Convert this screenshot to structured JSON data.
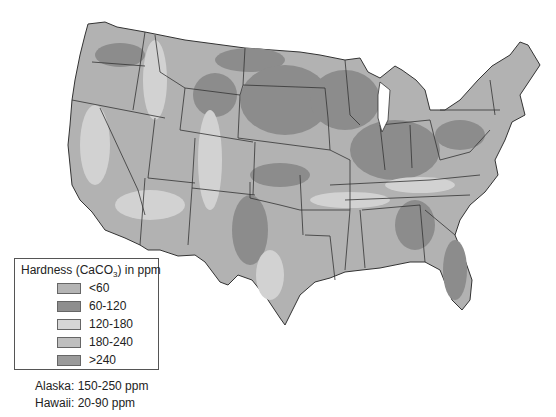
{
  "map": {
    "subject": "Water hardness across the contiguous United States",
    "region": "Contiguous United States"
  },
  "legend": {
    "title_prefix": "Hardness (CaCO",
    "title_sub": "3",
    "title_suffix": ") in ppm",
    "items": [
      {
        "label": "<60",
        "color": "#b4b4b4"
      },
      {
        "label": "60-120",
        "color": "#8e8e8e"
      },
      {
        "label": "120-180",
        "color": "#d6d6d6"
      },
      {
        "label": "180-240",
        "color": "#bfbfbf"
      },
      {
        "label": ">240",
        "color": "#9a9a9a"
      }
    ]
  },
  "notes": {
    "alaska": "Alaska: 150-250 ppm",
    "hawaii": "Hawaii: 20-90 ppm"
  },
  "colors": {
    "border": "#333333",
    "base": "#b0b0b0",
    "dark": "#8c8c8c",
    "light": "#d2d2d2"
  }
}
